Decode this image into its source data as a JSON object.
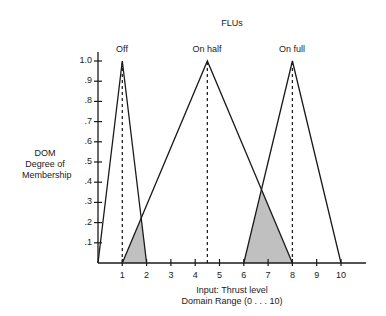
{
  "chart_data": {
    "type": "line",
    "title": "FLUs",
    "xlabel": "Input: Thrust level",
    "xlabel_sub": "Domain Range (0 . . . 10)",
    "ylabel": "DOM",
    "ylabel_sub1": "Degree of",
    "ylabel_sub2": "Membership",
    "x_ticks": [
      "1",
      "2",
      "3",
      "4",
      "5",
      "6",
      "7",
      "8",
      "9",
      "10"
    ],
    "y_ticks": [
      ".1",
      ".2",
      ".3",
      ".4",
      ".5",
      ".6",
      ".7",
      ".8",
      ".9",
      "1.0"
    ],
    "xlim": [
      0,
      11
    ],
    "ylim": [
      0,
      1.0
    ],
    "grid": false,
    "series": [
      {
        "name": "Off",
        "points": [
          [
            0,
            0
          ],
          [
            1,
            1
          ],
          [
            2,
            0
          ]
        ]
      },
      {
        "name": "On half",
        "points": [
          [
            1,
            0
          ],
          [
            4.5,
            1
          ],
          [
            8,
            0
          ]
        ]
      },
      {
        "name": "On full",
        "points": [
          [
            6,
            0
          ],
          [
            8,
            1
          ],
          [
            10,
            0
          ]
        ]
      }
    ],
    "shaded_regions": [
      {
        "points": [
          [
            1,
            0
          ],
          [
            1.78,
            0.22
          ],
          [
            2,
            0
          ]
        ],
        "color": "#c0c0c0"
      },
      {
        "points": [
          [
            6,
            0
          ],
          [
            6.75,
            0.36
          ],
          [
            8,
            0
          ]
        ],
        "color": "#c0c0c0"
      }
    ],
    "dashed_verticals": [
      1,
      4.5,
      8
    ]
  }
}
